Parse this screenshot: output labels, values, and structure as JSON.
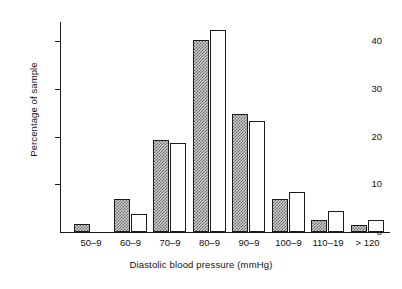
{
  "chart_data": {
    "type": "bar",
    "title": "",
    "xlabel": "Diastolic blood pressure (mmHg)",
    "ylabel": "Percentage of sample",
    "categories": [
      "50–9",
      "60–9",
      "70–9",
      "80–9",
      "90–9",
      "100–9",
      "110–19",
      "> 120"
    ],
    "series": [
      {
        "name": "shaded",
        "style": "stippled-grey",
        "values": [
          1.6,
          7.0,
          19.3,
          40.3,
          24.8,
          7.0,
          2.5,
          1.5
        ]
      },
      {
        "name": "open",
        "style": "white-outline",
        "values": [
          0,
          3.7,
          18.7,
          42.3,
          23.2,
          8.4,
          4.4,
          2.5
        ]
      }
    ],
    "ylim": [
      0,
      44
    ],
    "yticks": [
      0,
      10,
      20,
      30,
      40
    ],
    "ytick_labels": [
      "0",
      "10",
      "20",
      "30",
      "40"
    ],
    "grid": false,
    "legend": "none"
  },
  "colors": {
    "axis": "#1a1a1a",
    "bar_outline": "#1a1a1a",
    "bar_shaded_fill": "#c9c9c9",
    "bar_shaded_stipple": "#6f6f6f",
    "bar_open_fill": "#ffffff",
    "background": "#ffffff"
  }
}
